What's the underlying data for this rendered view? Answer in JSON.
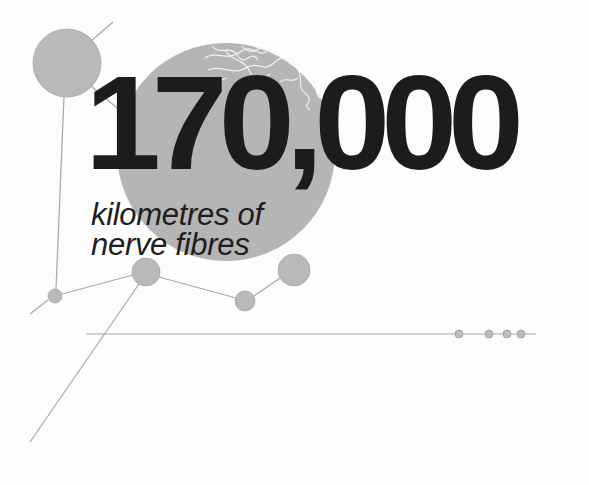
{
  "headline": {
    "number": "170,000",
    "line1": "kilometres of",
    "line2": "nerve fibres"
  },
  "colors": {
    "background": "#fdfdfd",
    "text": "#1c1c1c",
    "node_fill": "#b9b9b9",
    "big_circle_fill": "#b5b5b5",
    "line": "#a8a8a8",
    "fibre": "#f2f2f2"
  },
  "graphic": {
    "big_circle": {
      "cx": 226,
      "cy": 152,
      "r": 109
    },
    "nodes": [
      {
        "name": "top-left-node",
        "cx": 67,
        "cy": 63,
        "r": 34
      },
      {
        "name": "small-left-node",
        "cx": 55,
        "cy": 296,
        "r": 7
      },
      {
        "name": "center-node",
        "cx": 146,
        "cy": 272,
        "r": 14
      },
      {
        "name": "lower-node",
        "cx": 245,
        "cy": 301,
        "r": 10
      },
      {
        "name": "right-node",
        "cx": 294,
        "cy": 270,
        "r": 16
      }
    ],
    "timeline": {
      "x1": 86,
      "x2": 536,
      "y": 334,
      "dots": [
        459,
        489,
        507,
        521
      ]
    }
  }
}
